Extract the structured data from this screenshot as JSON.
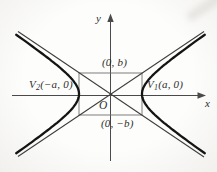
{
  "labels": {
    "y_axis": "y",
    "x_axis": "x",
    "origin": "O",
    "top_point": "(0, b)",
    "bottom_point": "(0, −b)",
    "v1": {
      "pre": "V",
      "sub": "1",
      "post": "(a, 0)"
    },
    "v2": {
      "pre": "V",
      "sub": "2",
      "post": "(−a, 0)"
    }
  },
  "colors": {
    "curve": "#141414",
    "asymptote": "#3d3d3d",
    "axis": "#4a4a4a",
    "rectangle": "#6f6f6f",
    "text": "#2d2d2d",
    "background": "#f3f2ef"
  }
}
